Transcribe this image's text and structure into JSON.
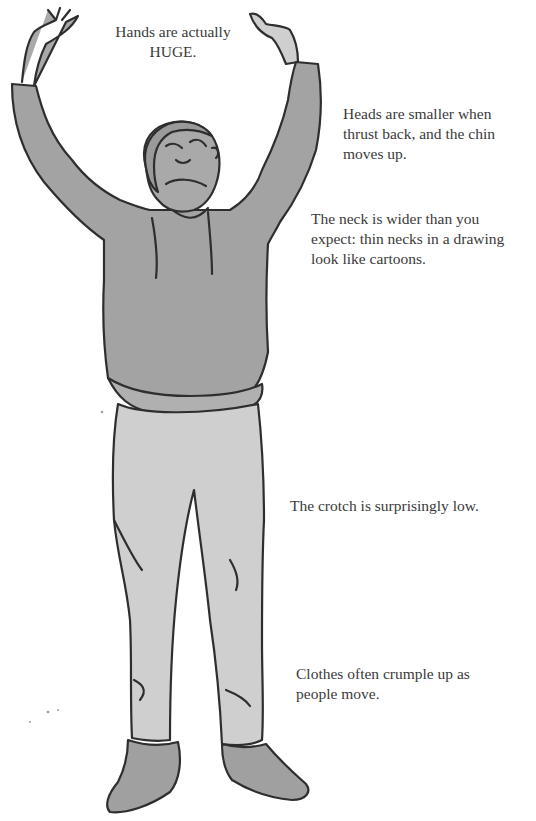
{
  "annotations": {
    "hands": {
      "lines": [
        "Hands are actually",
        "HUGE."
      ]
    },
    "head": {
      "lines": [
        "Heads are smaller when",
        "thrust back, and the chin",
        "moves up."
      ]
    },
    "neck": {
      "lines": [
        "The neck is wider than you",
        "expect: thin necks in a drawing",
        "look like cartoons."
      ]
    },
    "crotch": {
      "lines": [
        "The crotch is surprisingly low."
      ]
    },
    "clothes": {
      "lines": [
        "Clothes often crumple up as",
        "people move."
      ]
    }
  },
  "illustration": {
    "subject": "standing man with arms raised overhead, head tilted back",
    "colors": {
      "background": "#ffffff",
      "outline": "#2e2e2e",
      "sweatshirt": "#a3a3a3",
      "skin": "#a9a9a9",
      "trousers": "#cfcfcf",
      "shoes": "#a0a0a0",
      "hair": "#9a9a9a",
      "text": "#3a3a3a"
    }
  }
}
